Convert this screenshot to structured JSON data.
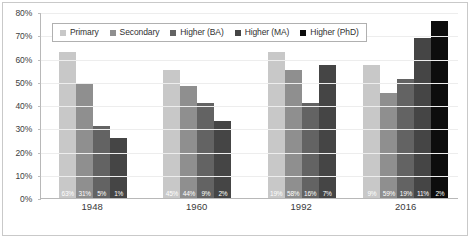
{
  "chart_data": {
    "type": "bar",
    "title": "",
    "subtitle": "",
    "xlabel": "",
    "ylabel": "",
    "categories": [
      "1948",
      "1960",
      "1992",
      "2016"
    ],
    "ylim": [
      0,
      80
    ],
    "ytick_labels": [
      "0%",
      "10%",
      "20%",
      "30%",
      "40%",
      "50%",
      "60%",
      "70%",
      "80%"
    ],
    "ytick_values": [
      0,
      10,
      20,
      30,
      40,
      50,
      60,
      70,
      80
    ],
    "grid": true,
    "legend_position": "top-left-inside",
    "series": [
      {
        "name": "Primary",
        "color": "#c8c8c8",
        "values": [
          63,
          55,
          63,
          57
        ],
        "data_labels": [
          "63%",
          "45%",
          "19%",
          "9%"
        ]
      },
      {
        "name": "Secondary",
        "color": "#8f8f8f",
        "values": [
          49,
          48,
          55,
          45
        ],
        "data_labels": [
          "31%",
          "44%",
          "58%",
          "59%"
        ]
      },
      {
        "name": "Higher (BA)",
        "color": "#636363",
        "values": [
          31,
          41,
          41,
          51
        ],
        "data_labels": [
          "5%",
          "9%",
          "16%",
          "19%"
        ]
      },
      {
        "name": "Higher (MA)",
        "color": "#454545",
        "values": [
          26,
          33,
          57,
          69
        ],
        "data_labels": [
          "1%",
          "2%",
          "7%",
          "11%"
        ]
      },
      {
        "name": "Higher (PhD)",
        "color": "#0d0d0d",
        "values": [
          null,
          null,
          null,
          76
        ],
        "data_labels": [
          null,
          null,
          null,
          "2%"
        ]
      }
    ]
  },
  "legend": {
    "items": [
      {
        "label": "Primary",
        "color": "#c8c8c8"
      },
      {
        "label": "Secondary",
        "color": "#8f8f8f"
      },
      {
        "label": "Higher (BA)",
        "color": "#636363"
      },
      {
        "label": "Higher (MA)",
        "color": "#454545"
      },
      {
        "label": "Higher (PhD)",
        "color": "#0d0d0d"
      }
    ]
  }
}
